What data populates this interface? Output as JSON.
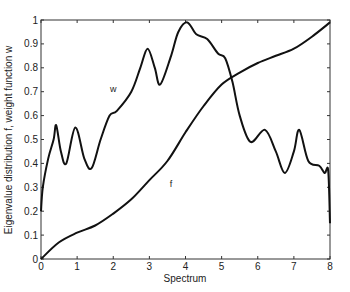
{
  "chart_data": {
    "type": "line",
    "title": "",
    "xlabel": "Spectrum",
    "ylabel": "Eigenvalue distribution f, weight function w",
    "xlim": [
      0,
      8
    ],
    "ylim": [
      0,
      1
    ],
    "grid": false,
    "legend": "none (inline curve labels)",
    "x_ticks": [
      "0",
      "1",
      "2",
      "3",
      "4",
      "5",
      "6",
      "7",
      "8"
    ],
    "y_ticks": [
      "0",
      "0.1",
      "0.2",
      "0.3",
      "0.4",
      "0.5",
      "0.6",
      "0.7",
      "0.8",
      "0.9",
      "1"
    ],
    "series": [
      {
        "name": "w",
        "label_position": [
          2.0,
          0.7
        ],
        "x": [
          0,
          0.05,
          0.2,
          0.35,
          0.42,
          0.55,
          0.7,
          0.95,
          1.2,
          1.4,
          1.65,
          1.9,
          2.1,
          2.5,
          2.75,
          2.95,
          3.15,
          3.3,
          3.6,
          3.8,
          4.05,
          4.3,
          4.6,
          4.9,
          5.1,
          5.3,
          5.5,
          5.8,
          6.2,
          6.5,
          6.75,
          7.0,
          7.15,
          7.4,
          7.7,
          7.85,
          7.95,
          8.0
        ],
        "values": [
          0.2,
          0.3,
          0.42,
          0.5,
          0.56,
          0.45,
          0.4,
          0.55,
          0.42,
          0.38,
          0.5,
          0.6,
          0.62,
          0.7,
          0.8,
          0.88,
          0.8,
          0.73,
          0.85,
          0.95,
          0.99,
          0.94,
          0.92,
          0.86,
          0.84,
          0.74,
          0.6,
          0.49,
          0.54,
          0.45,
          0.36,
          0.45,
          0.54,
          0.41,
          0.39,
          0.36,
          0.37,
          0.15
        ]
      },
      {
        "name": "f",
        "label_position": [
          3.6,
          0.3
        ],
        "x": [
          0,
          0.5,
          1,
          1.5,
          2,
          2.5,
          3,
          3.5,
          4,
          4.5,
          5,
          5.5,
          6,
          6.5,
          7,
          7.5,
          8
        ],
        "values": [
          0,
          0.07,
          0.11,
          0.14,
          0.19,
          0.25,
          0.33,
          0.41,
          0.53,
          0.64,
          0.73,
          0.78,
          0.82,
          0.85,
          0.88,
          0.93,
          0.99
        ]
      }
    ]
  }
}
